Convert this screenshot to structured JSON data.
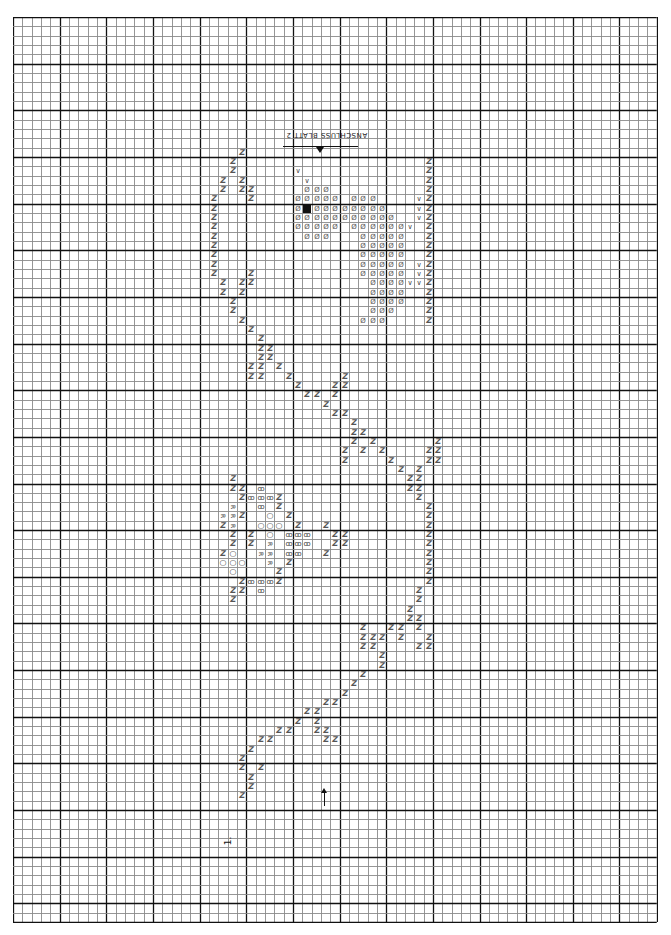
{
  "chart": {
    "title_upside_down": "ANSCHLUSS BLATT 2",
    "page_number": "1.",
    "grid": {
      "origin_x": 13,
      "origin_y": 17,
      "cell": 9.33,
      "cols": 69,
      "rows": 97,
      "major_every": 5,
      "minor_color": "#8a8a8a",
      "major_color": "#111111"
    },
    "legend_symbols": {
      "Z": "diagonal zigzag stitch",
      "D": "circle with slash (dotted fill)",
      "B": "solid black square",
      "V": "V / triangle mark",
      "O": "open circle",
      "X": "crossed-loop symbol",
      "R": "R-shaped symbol"
    },
    "glyphs": {
      "Z": "Z",
      "D": "Ø",
      "V": "∨",
      "O": "○",
      "X": "ꝏ",
      "R": "R",
      "B": ""
    },
    "cells": [
      [
        24,
        14,
        "Z"
      ],
      [
        23,
        15,
        "Z"
      ],
      [
        23,
        16,
        "Z"
      ],
      [
        22,
        17,
        "Z"
      ],
      [
        24,
        17,
        "Z"
      ],
      [
        22,
        18,
        "Z"
      ],
      [
        24,
        18,
        "Z"
      ],
      [
        25,
        18,
        "Z"
      ],
      [
        25,
        19,
        "Z"
      ],
      [
        21,
        19,
        "Z"
      ],
      [
        21,
        20,
        "Z"
      ],
      [
        21,
        21,
        "Z"
      ],
      [
        21,
        22,
        "Z"
      ],
      [
        21,
        23,
        "Z"
      ],
      [
        21,
        24,
        "Z"
      ],
      [
        21,
        25,
        "Z"
      ],
      [
        21,
        26,
        "Z"
      ],
      [
        21,
        27,
        "Z"
      ],
      [
        25,
        27,
        "Z"
      ],
      [
        22,
        28,
        "Z"
      ],
      [
        24,
        28,
        "Z"
      ],
      [
        25,
        28,
        "Z"
      ],
      [
        22,
        29,
        "Z"
      ],
      [
        24,
        29,
        "Z"
      ],
      [
        23,
        30,
        "Z"
      ],
      [
        23,
        31,
        "Z"
      ],
      [
        24,
        32,
        "Z"
      ],
      [
        25,
        33,
        "Z"
      ],
      [
        26,
        34,
        "Z"
      ],
      [
        30,
        16,
        "V"
      ],
      [
        31,
        17,
        "V"
      ],
      [
        31,
        18,
        "D"
      ],
      [
        32,
        18,
        "D"
      ],
      [
        33,
        18,
        "D"
      ],
      [
        30,
        19,
        "D"
      ],
      [
        31,
        19,
        "D"
      ],
      [
        32,
        19,
        "D"
      ],
      [
        33,
        19,
        "D"
      ],
      [
        34,
        19,
        "D"
      ],
      [
        36,
        19,
        "D"
      ],
      [
        37,
        19,
        "D"
      ],
      [
        38,
        19,
        "D"
      ],
      [
        30,
        20,
        "D"
      ],
      [
        31,
        20,
        "B"
      ],
      [
        32,
        20,
        "D"
      ],
      [
        33,
        20,
        "D"
      ],
      [
        34,
        20,
        "D"
      ],
      [
        35,
        20,
        "D"
      ],
      [
        36,
        20,
        "D"
      ],
      [
        37,
        20,
        "D"
      ],
      [
        38,
        20,
        "D"
      ],
      [
        39,
        20,
        "D"
      ],
      [
        30,
        21,
        "D"
      ],
      [
        31,
        21,
        "D"
      ],
      [
        32,
        21,
        "D"
      ],
      [
        33,
        21,
        "D"
      ],
      [
        34,
        21,
        "D"
      ],
      [
        35,
        21,
        "D"
      ],
      [
        36,
        21,
        "D"
      ],
      [
        37,
        21,
        "D"
      ],
      [
        38,
        21,
        "D"
      ],
      [
        39,
        21,
        "D"
      ],
      [
        40,
        21,
        "D"
      ],
      [
        30,
        22,
        "D"
      ],
      [
        31,
        22,
        "D"
      ],
      [
        32,
        22,
        "D"
      ],
      [
        33,
        22,
        "D"
      ],
      [
        34,
        22,
        "D"
      ],
      [
        36,
        22,
        "D"
      ],
      [
        37,
        22,
        "D"
      ],
      [
        38,
        22,
        "D"
      ],
      [
        39,
        22,
        "D"
      ],
      [
        40,
        22,
        "D"
      ],
      [
        41,
        22,
        "D"
      ],
      [
        42,
        22,
        "V"
      ],
      [
        31,
        23,
        "D"
      ],
      [
        32,
        23,
        "D"
      ],
      [
        33,
        23,
        "D"
      ],
      [
        37,
        23,
        "D"
      ],
      [
        38,
        23,
        "D"
      ],
      [
        39,
        23,
        "D"
      ],
      [
        40,
        23,
        "D"
      ],
      [
        41,
        23,
        "D"
      ],
      [
        37,
        24,
        "D"
      ],
      [
        38,
        24,
        "D"
      ],
      [
        39,
        24,
        "D"
      ],
      [
        40,
        24,
        "D"
      ],
      [
        41,
        24,
        "D"
      ],
      [
        37,
        25,
        "D"
      ],
      [
        38,
        25,
        "D"
      ],
      [
        39,
        25,
        "D"
      ],
      [
        40,
        25,
        "D"
      ],
      [
        41,
        25,
        "D"
      ],
      [
        37,
        26,
        "D"
      ],
      [
        38,
        26,
        "D"
      ],
      [
        39,
        26,
        "D"
      ],
      [
        40,
        26,
        "D"
      ],
      [
        41,
        26,
        "D"
      ],
      [
        43,
        26,
        "V"
      ],
      [
        37,
        27,
        "D"
      ],
      [
        38,
        27,
        "D"
      ],
      [
        39,
        27,
        "D"
      ],
      [
        40,
        27,
        "D"
      ],
      [
        41,
        27,
        "D"
      ],
      [
        43,
        27,
        "V"
      ],
      [
        38,
        28,
        "D"
      ],
      [
        39,
        28,
        "D"
      ],
      [
        40,
        28,
        "D"
      ],
      [
        41,
        28,
        "D"
      ],
      [
        42,
        28,
        "V"
      ],
      [
        43,
        28,
        "V"
      ],
      [
        38,
        29,
        "D"
      ],
      [
        39,
        29,
        "D"
      ],
      [
        40,
        29,
        "D"
      ],
      [
        41,
        29,
        "D"
      ],
      [
        38,
        30,
        "D"
      ],
      [
        39,
        30,
        "D"
      ],
      [
        40,
        30,
        "D"
      ],
      [
        41,
        30,
        "D"
      ],
      [
        38,
        31,
        "D"
      ],
      [
        39,
        31,
        "D"
      ],
      [
        40,
        31,
        "D"
      ],
      [
        37,
        32,
        "D"
      ],
      [
        38,
        32,
        "D"
      ],
      [
        39,
        32,
        "D"
      ],
      [
        43,
        19,
        "V"
      ],
      [
        43,
        20,
        "V"
      ],
      [
        43,
        21,
        "V"
      ],
      [
        44,
        15,
        "Z"
      ],
      [
        44,
        16,
        "Z"
      ],
      [
        44,
        17,
        "Z"
      ],
      [
        44,
        18,
        "Z"
      ],
      [
        44,
        19,
        "Z"
      ],
      [
        44,
        20,
        "Z"
      ],
      [
        44,
        21,
        "Z"
      ],
      [
        44,
        22,
        "Z"
      ],
      [
        44,
        23,
        "Z"
      ],
      [
        44,
        24,
        "Z"
      ],
      [
        44,
        25,
        "Z"
      ],
      [
        44,
        26,
        "Z"
      ],
      [
        44,
        27,
        "Z"
      ],
      [
        44,
        28,
        "Z"
      ],
      [
        44,
        29,
        "Z"
      ],
      [
        44,
        30,
        "Z"
      ],
      [
        44,
        31,
        "Z"
      ],
      [
        44,
        32,
        "Z"
      ],
      [
        26,
        35,
        "Z"
      ],
      [
        27,
        36,
        "Z"
      ],
      [
        28,
        37,
        "Z"
      ],
      [
        29,
        38,
        "Z"
      ],
      [
        30,
        39,
        "Z"
      ],
      [
        31,
        40,
        "Z"
      ],
      [
        32,
        40,
        "Z"
      ],
      [
        33,
        41,
        "Z"
      ],
      [
        34,
        42,
        "Z"
      ],
      [
        35,
        42,
        "Z"
      ],
      [
        25,
        37,
        "Z"
      ],
      [
        25,
        38,
        "Z"
      ],
      [
        26,
        37,
        "Z"
      ],
      [
        26,
        38,
        "Z"
      ],
      [
        26,
        36,
        "Z"
      ],
      [
        27,
        35,
        "Z"
      ],
      [
        34,
        39,
        "Z"
      ],
      [
        34,
        40,
        "Z"
      ],
      [
        35,
        38,
        "Z"
      ],
      [
        35,
        39,
        "Z"
      ],
      [
        36,
        43,
        "Z"
      ],
      [
        37,
        44,
        "Z"
      ],
      [
        38,
        45,
        "Z"
      ],
      [
        39,
        46,
        "Z"
      ],
      [
        40,
        47,
        "Z"
      ],
      [
        41,
        48,
        "Z"
      ],
      [
        42,
        49,
        "Z"
      ],
      [
        42,
        50,
        "Z"
      ],
      [
        36,
        44,
        "Z"
      ],
      [
        36,
        45,
        "Z"
      ],
      [
        37,
        46,
        "Z"
      ],
      [
        35,
        46,
        "Z"
      ],
      [
        35,
        47,
        "Z"
      ],
      [
        44,
        46,
        "Z"
      ],
      [
        44,
        47,
        "Z"
      ],
      [
        45,
        46,
        "Z"
      ],
      [
        45,
        47,
        "Z"
      ],
      [
        45,
        45,
        "Z"
      ],
      [
        43,
        48,
        "Z"
      ],
      [
        43,
        49,
        "Z"
      ],
      [
        43,
        50,
        "Z"
      ],
      [
        43,
        51,
        "Z"
      ],
      [
        44,
        52,
        "Z"
      ],
      [
        44,
        53,
        "Z"
      ],
      [
        44,
        54,
        "Z"
      ],
      [
        44,
        55,
        "Z"
      ],
      [
        44,
        56,
        "Z"
      ],
      [
        44,
        57,
        "Z"
      ],
      [
        44,
        58,
        "Z"
      ],
      [
        44,
        59,
        "Z"
      ],
      [
        44,
        60,
        "Z"
      ],
      [
        43,
        61,
        "Z"
      ],
      [
        43,
        62,
        "Z"
      ],
      [
        42,
        63,
        "Z"
      ],
      [
        42,
        64,
        "Z"
      ],
      [
        41,
        65,
        "Z"
      ],
      [
        41,
        66,
        "Z"
      ],
      [
        43,
        64,
        "Z"
      ],
      [
        43,
        65,
        "Z"
      ],
      [
        44,
        66,
        "Z"
      ],
      [
        44,
        67,
        "Z"
      ],
      [
        43,
        67,
        "Z"
      ],
      [
        37,
        65,
        "Z"
      ],
      [
        37,
        66,
        "Z"
      ],
      [
        38,
        66,
        "Z"
      ],
      [
        38,
        67,
        "Z"
      ],
      [
        39,
        68,
        "Z"
      ],
      [
        39,
        69,
        "Z"
      ],
      [
        40,
        65,
        "Z"
      ],
      [
        39,
        66,
        "Z"
      ],
      [
        37,
        67,
        "Z"
      ],
      [
        23,
        49,
        "Z"
      ],
      [
        23,
        50,
        "Z"
      ],
      [
        24,
        50,
        "Z"
      ],
      [
        26,
        50,
        "X"
      ],
      [
        24,
        51,
        "Z"
      ],
      [
        25,
        51,
        "X"
      ],
      [
        26,
        51,
        "X"
      ],
      [
        27,
        51,
        "X"
      ],
      [
        28,
        51,
        "Z"
      ],
      [
        23,
        52,
        "R"
      ],
      [
        26,
        52,
        "X"
      ],
      [
        28,
        52,
        "Z"
      ],
      [
        22,
        53,
        "R"
      ],
      [
        23,
        53,
        "R"
      ],
      [
        24,
        53,
        "Z"
      ],
      [
        27,
        53,
        "O"
      ],
      [
        29,
        53,
        "Z"
      ],
      [
        22,
        54,
        "Z"
      ],
      [
        23,
        54,
        "R"
      ],
      [
        26,
        54,
        "O"
      ],
      [
        27,
        54,
        "O"
      ],
      [
        28,
        54,
        "O"
      ],
      [
        30,
        54,
        "Z"
      ],
      [
        33,
        54,
        "Z"
      ],
      [
        23,
        55,
        "Z"
      ],
      [
        25,
        55,
        "Z"
      ],
      [
        27,
        55,
        "O"
      ],
      [
        29,
        55,
        "X"
      ],
      [
        30,
        55,
        "X"
      ],
      [
        31,
        55,
        "X"
      ],
      [
        34,
        55,
        "Z"
      ],
      [
        35,
        55,
        "Z"
      ],
      [
        23,
        56,
        "Z"
      ],
      [
        25,
        56,
        "Z"
      ],
      [
        27,
        56,
        "R"
      ],
      [
        29,
        56,
        "X"
      ],
      [
        30,
        56,
        "X"
      ],
      [
        31,
        56,
        "X"
      ],
      [
        34,
        56,
        "Z"
      ],
      [
        35,
        56,
        "Z"
      ],
      [
        22,
        57,
        "Z"
      ],
      [
        23,
        57,
        "O"
      ],
      [
        26,
        57,
        "R"
      ],
      [
        27,
        57,
        "R"
      ],
      [
        29,
        57,
        "X"
      ],
      [
        30,
        57,
        "X"
      ],
      [
        33,
        57,
        "Z"
      ],
      [
        22,
        58,
        "O"
      ],
      [
        23,
        58,
        "O"
      ],
      [
        24,
        58,
        "O"
      ],
      [
        27,
        58,
        "R"
      ],
      [
        29,
        58,
        "Z"
      ],
      [
        23,
        59,
        "O"
      ],
      [
        28,
        59,
        "Z"
      ],
      [
        24,
        60,
        "Z"
      ],
      [
        25,
        60,
        "X"
      ],
      [
        26,
        60,
        "X"
      ],
      [
        27,
        60,
        "X"
      ],
      [
        28,
        60,
        "Z"
      ],
      [
        23,
        61,
        "Z"
      ],
      [
        24,
        61,
        "Z"
      ],
      [
        26,
        61,
        "X"
      ],
      [
        23,
        62,
        "Z"
      ],
      [
        37,
        70,
        "Z"
      ],
      [
        36,
        71,
        "Z"
      ],
      [
        35,
        72,
        "Z"
      ],
      [
        34,
        73,
        "Z"
      ],
      [
        33,
        73,
        "Z"
      ],
      [
        32,
        74,
        "Z"
      ],
      [
        31,
        74,
        "Z"
      ],
      [
        30,
        75,
        "Z"
      ],
      [
        29,
        76,
        "Z"
      ],
      [
        28,
        76,
        "Z"
      ],
      [
        27,
        77,
        "Z"
      ],
      [
        26,
        77,
        "Z"
      ],
      [
        25,
        78,
        "Z"
      ],
      [
        24,
        79,
        "Z"
      ],
      [
        24,
        80,
        "Z"
      ],
      [
        25,
        81,
        "Z"
      ],
      [
        26,
        80,
        "Z"
      ],
      [
        25,
        82,
        "Z"
      ],
      [
        24,
        83,
        "Z"
      ],
      [
        32,
        75,
        "Z"
      ],
      [
        32,
        76,
        "Z"
      ],
      [
        33,
        76,
        "Z"
      ],
      [
        33,
        77,
        "Z"
      ],
      [
        34,
        77,
        "Z"
      ]
    ],
    "arrow": {
      "x": 324,
      "y_top": 788,
      "y_bottom": 806,
      "direction": "up"
    },
    "top_marker": {
      "line_x1": 283,
      "line_x2": 358,
      "line_y": 146,
      "triangle_x": 320,
      "text_x": 286,
      "text_y": 131
    },
    "page_number_pos": {
      "x": 224,
      "y": 836
    }
  }
}
